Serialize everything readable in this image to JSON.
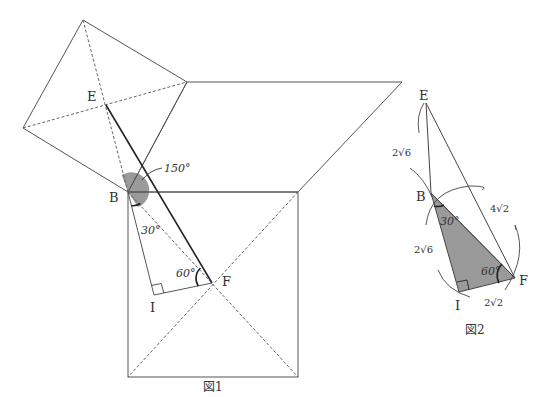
{
  "figure1": {
    "caption": "図1",
    "points": {
      "E": "E",
      "B": "B",
      "F": "F",
      "I": "I"
    },
    "angles": {
      "obtuse": "150°",
      "at_B": "30°",
      "at_F": "60°"
    }
  },
  "figure2": {
    "caption": "図2",
    "points": {
      "E": "E",
      "B": "B",
      "F": "F",
      "I": "I"
    },
    "angles": {
      "at_B": "30°",
      "at_F": "60°"
    },
    "lengths": {
      "EB": "2√6",
      "BI": "2√6",
      "BF": "4√2",
      "IF": "2√2"
    }
  },
  "colors": {
    "line": "#555555",
    "bold_line": "#222222",
    "shade": "#9a9a9a"
  }
}
